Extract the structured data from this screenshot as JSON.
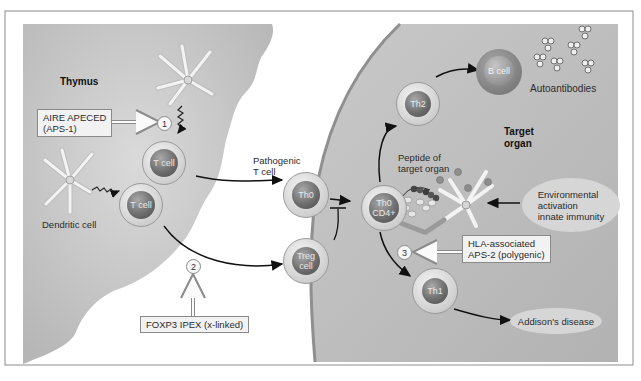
{
  "figure": {
    "regions": {
      "thymus": "Thymus",
      "target_organ": [
        "Target",
        "organ"
      ]
    },
    "cells": {
      "thymus_t_cell_upper": "T cell",
      "thymus_t_cell_lower": "T cell",
      "dendritic_cell": "Dendritic cell",
      "pathogenic_label": [
        "Pathogenic",
        "T cell"
      ],
      "th0": "Th0",
      "treg": [
        "Treg",
        "cell"
      ],
      "th0_cd4": [
        "Th0",
        "CD4+"
      ],
      "th2": "Th2",
      "b_cell": "B cell",
      "th1": "Th1"
    },
    "labels": {
      "autoantibodies": "Autoantibodies",
      "peptide": [
        "Peptide of",
        "target organ"
      ],
      "environmental": [
        "Environmental",
        "activation",
        "innate immunity"
      ],
      "addisons": "Addison's disease"
    },
    "boxes": {
      "aire": [
        "AIRE APECED",
        "(APS-1)"
      ],
      "foxp3": "FOXP3 IPEX (x-linked)",
      "hla": [
        "HLA-associated",
        "APS-2 (polygenic)"
      ]
    },
    "markers": {
      "one": "1",
      "two": "2",
      "three": "3"
    }
  },
  "colors": {
    "background": "#ffffff",
    "frame": "#8c8c8c",
    "thymus_fill": "#c4c4c4",
    "organ_fill": "#bdbdbd",
    "membrane": "#8f8f8f",
    "ellipse_fill": "#d6d6d6",
    "box_fill": "#f2f2f2",
    "arrow": "#111111"
  }
}
